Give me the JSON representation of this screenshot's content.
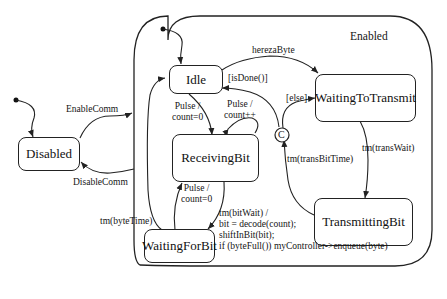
{
  "diagram": {
    "type": "UML state machine",
    "composite_state": {
      "name": "Enabled"
    },
    "states": [
      {
        "id": "disabled",
        "name": "Disabled"
      },
      {
        "id": "idle",
        "name": "Idle"
      },
      {
        "id": "receiving",
        "name": "ReceivingBit"
      },
      {
        "id": "waitingforbit",
        "name": "WaitingForBit"
      },
      {
        "id": "waitingtotransmit",
        "name": "WaitingToTransmit"
      },
      {
        "id": "transmitting",
        "name": "TransmittingBit"
      }
    ],
    "choice": {
      "label": "C"
    },
    "transitions": {
      "enable": "EnableComm",
      "disable": "DisableComm",
      "hereza": "herezaByte",
      "isdone": "[isDone()]",
      "else": "[else]",
      "pulse_idle_1": "Pulse /",
      "pulse_idle_2": "count=0",
      "pulse_self_1": "Pulse /",
      "pulse_self_2": "count++",
      "pulse_wait_1": "Pulse /",
      "pulse_wait_2": "count=0",
      "bytetime": "tm(byteTime)",
      "transwait": "tm(transWait)",
      "transbittime": "tm(transBitTime)",
      "bitwait_1": "tm(bitWait) /",
      "bitwait_2": "bit = decode(count);",
      "bitwait_3": "shiftInBit(bit);",
      "bitwait_4": "if (byteFull()) myController->enqueue(byte)"
    }
  }
}
